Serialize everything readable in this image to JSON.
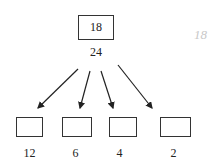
{
  "root": {
    "box_text": "18",
    "label": "24"
  },
  "children": [
    {
      "label": "12"
    },
    {
      "label": "6"
    },
    {
      "label": "4"
    },
    {
      "label": "2"
    }
  ],
  "annotation": {
    "text": "18"
  }
}
